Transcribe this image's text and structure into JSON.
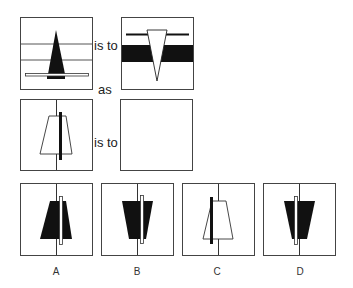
{
  "puzzle": {
    "type": "visual-analogy",
    "connectors": {
      "is_to_1": "is to",
      "as": "as",
      "is_to_2": "is to"
    },
    "panels": {
      "p1": {
        "description": "Tall black triangle pointing up with white horizontal bar across base and black base block, three horizontal lines"
      },
      "p2": {
        "description": "White inverted triangle pointing down over black horizontal band, thin black line at top"
      },
      "p3": {
        "description": "White trapezoid (narrow top) with thick black vertical bar, vertical center line"
      },
      "p4": {
        "description": "Empty answer box"
      }
    },
    "options": [
      {
        "label": "A",
        "description": "Black trapezoid narrow top with white vertical bar"
      },
      {
        "label": "B",
        "description": "Black inverted trapezoid wide top with white vertical bar"
      },
      {
        "label": "C",
        "description": "White trapezoid narrow top with black vertical bar"
      },
      {
        "label": "D",
        "description": "Black inverted trapezoid with white bar on left"
      }
    ],
    "colors": {
      "stroke": "#333333",
      "fill_dark": "#111111",
      "background": "#ffffff"
    }
  }
}
